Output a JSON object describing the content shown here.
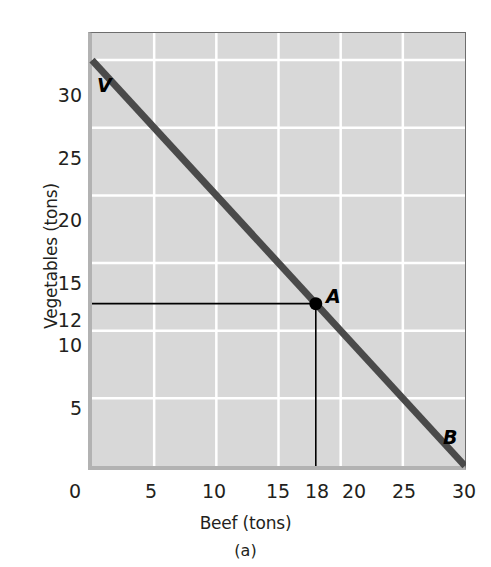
{
  "figure": {
    "panel_label": "(a)",
    "background_color": "#ffffff",
    "plot_background_color": "#d8d8d8",
    "grid_color": "#ffffff",
    "line_color": "#4a4a4a",
    "guide_color": "#000000"
  },
  "chart_data": {
    "type": "line",
    "title": "",
    "subtitle": "",
    "xlabel": "Beef (tons)",
    "ylabel": "Vegetables (tons)",
    "xlim": [
      0,
      30
    ],
    "ylim": [
      0,
      32
    ],
    "grid": true,
    "legend": null,
    "x_ticks": [
      0,
      5,
      10,
      15,
      18,
      20,
      25,
      30
    ],
    "x_tick_labels": [
      "0",
      "5",
      "10",
      "15",
      "18",
      "20",
      "25",
      "30"
    ],
    "y_ticks": [
      5,
      10,
      12,
      15,
      20,
      25,
      30
    ],
    "y_tick_labels": [
      "5",
      "10",
      "12",
      "15",
      "20",
      "25",
      "30"
    ],
    "x_gridlines": [
      5,
      10,
      15,
      20,
      25
    ],
    "y_gridlines": [
      5,
      10,
      15,
      20,
      25,
      30
    ],
    "series": [
      {
        "name": "Production possibilities frontier",
        "type": "line",
        "x": [
          0,
          30
        ],
        "y": [
          30,
          0
        ]
      }
    ],
    "annotations": [
      {
        "label": "V",
        "x": 0,
        "y": 30,
        "style": "bold-italic",
        "position": "above-right"
      },
      {
        "label": "A",
        "x": 18,
        "y": 12,
        "style": "bold-italic",
        "position": "above-right",
        "marker": "filled-circle"
      },
      {
        "label": "B",
        "x": 30,
        "y": 0,
        "style": "bold-italic",
        "position": "above-left"
      }
    ],
    "guide_lines": [
      {
        "from": [
          0,
          12
        ],
        "to": [
          18,
          12
        ],
        "orientation": "horizontal"
      },
      {
        "from": [
          18,
          12
        ],
        "to": [
          18,
          0
        ],
        "orientation": "vertical"
      }
    ],
    "marker_points": [
      {
        "label": "A",
        "x": 18,
        "y": 12
      }
    ]
  }
}
